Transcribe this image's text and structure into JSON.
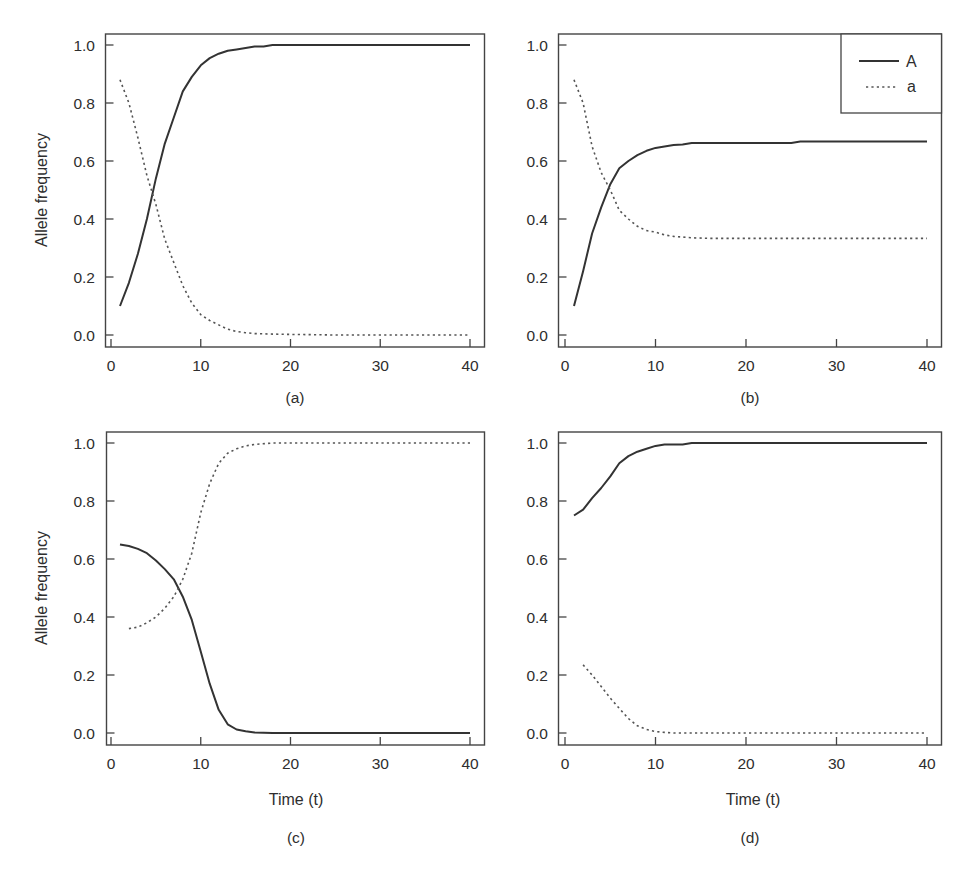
{
  "figure": {
    "y_axis_label": "Allele frequency",
    "x_axis_label": "Time (t)",
    "legend": {
      "solid_label": "A",
      "dotted_label": "a"
    },
    "x_ticks": [
      "0",
      "10",
      "20",
      "30",
      "40"
    ],
    "y_ticks": [
      "0.0",
      "0.2",
      "0.4",
      "0.6",
      "0.8",
      "1.0"
    ],
    "panels": [
      {
        "id": "a",
        "caption": "(a)"
      },
      {
        "id": "b",
        "caption": "(b)"
      },
      {
        "id": "c",
        "caption": "(c)"
      },
      {
        "id": "d",
        "caption": "(d)"
      }
    ]
  },
  "chart_data": [
    {
      "type": "line",
      "panel": "(a)",
      "title": "",
      "xlabel": "",
      "ylabel": "Allele frequency",
      "xlim": [
        0,
        40
      ],
      "ylim": [
        0,
        1
      ],
      "x_ticks": [
        0,
        10,
        20,
        30,
        40
      ],
      "y_ticks": [
        0.0,
        0.2,
        0.4,
        0.6,
        0.8,
        1.0
      ],
      "grid": false,
      "series": [
        {
          "name": "A",
          "style": "solid",
          "x": [
            1,
            2,
            3,
            4,
            5,
            6,
            7,
            8,
            9,
            10,
            11,
            12,
            13,
            14,
            15,
            16,
            17,
            18,
            20,
            25,
            30,
            35,
            40
          ],
          "values": [
            0.1,
            0.18,
            0.28,
            0.4,
            0.54,
            0.66,
            0.75,
            0.84,
            0.89,
            0.93,
            0.955,
            0.97,
            0.98,
            0.985,
            0.99,
            0.995,
            0.995,
            1.0,
            1.0,
            1.0,
            1.0,
            1.0,
            1.0
          ]
        },
        {
          "name": "a",
          "style": "dotted",
          "x": [
            1,
            2,
            3,
            4,
            5,
            6,
            7,
            8,
            9,
            10,
            11,
            12,
            13,
            14,
            15,
            16,
            18,
            20,
            25,
            30,
            35,
            40
          ],
          "values": [
            0.88,
            0.8,
            0.68,
            0.55,
            0.45,
            0.33,
            0.25,
            0.17,
            0.11,
            0.07,
            0.05,
            0.035,
            0.02,
            0.012,
            0.008,
            0.005,
            0.003,
            0.002,
            0.0,
            0.0,
            0.0,
            0.0
          ]
        }
      ]
    },
    {
      "type": "line",
      "panel": "(b)",
      "title": "",
      "xlabel": "",
      "ylabel": "",
      "xlim": [
        0,
        40
      ],
      "ylim": [
        0,
        1
      ],
      "x_ticks": [
        0,
        10,
        20,
        30,
        40
      ],
      "y_ticks": [
        0.0,
        0.2,
        0.4,
        0.6,
        0.8,
        1.0
      ],
      "grid": false,
      "legend": {
        "position": "upper right",
        "entries": [
          "A",
          "a"
        ]
      },
      "series": [
        {
          "name": "A",
          "style": "solid",
          "x": [
            1,
            2,
            3,
            4,
            5,
            6,
            7,
            8,
            9,
            10,
            11,
            12,
            13,
            14,
            16,
            20,
            25,
            26,
            30,
            35,
            40
          ],
          "values": [
            0.1,
            0.22,
            0.35,
            0.44,
            0.52,
            0.575,
            0.6,
            0.62,
            0.635,
            0.645,
            0.65,
            0.655,
            0.657,
            0.662,
            0.662,
            0.662,
            0.662,
            0.667,
            0.667,
            0.667,
            0.667
          ]
        },
        {
          "name": "a",
          "style": "dotted",
          "x": [
            1,
            2,
            3,
            4,
            5,
            6,
            7,
            8,
            9,
            10,
            11,
            12,
            14,
            16,
            20,
            25,
            30,
            35,
            40
          ],
          "values": [
            0.88,
            0.8,
            0.65,
            0.56,
            0.5,
            0.43,
            0.4,
            0.375,
            0.36,
            0.355,
            0.345,
            0.34,
            0.335,
            0.333,
            0.333,
            0.333,
            0.333,
            0.333,
            0.333
          ]
        }
      ]
    },
    {
      "type": "line",
      "panel": "(c)",
      "title": "",
      "xlabel": "Time (t)",
      "ylabel": "Allele frequency",
      "xlim": [
        0,
        40
      ],
      "ylim": [
        0,
        1
      ],
      "x_ticks": [
        0,
        10,
        20,
        30,
        40
      ],
      "y_ticks": [
        0.0,
        0.2,
        0.4,
        0.6,
        0.8,
        1.0
      ],
      "grid": false,
      "series": [
        {
          "name": "A",
          "style": "solid",
          "x": [
            1,
            2,
            3,
            4,
            5,
            6,
            7,
            8,
            9,
            10,
            11,
            12,
            13,
            14,
            15,
            16,
            18,
            20,
            25,
            30,
            35,
            40
          ],
          "values": [
            0.65,
            0.645,
            0.635,
            0.62,
            0.595,
            0.565,
            0.53,
            0.47,
            0.39,
            0.28,
            0.17,
            0.08,
            0.03,
            0.012,
            0.006,
            0.002,
            0.0,
            0.0,
            0.0,
            0.0,
            0.0,
            0.0
          ]
        },
        {
          "name": "a",
          "style": "dotted",
          "x": [
            2,
            3,
            4,
            5,
            6,
            7,
            8,
            9,
            10,
            11,
            12,
            13,
            14,
            15,
            16,
            18,
            20,
            25,
            30,
            35,
            40
          ],
          "values": [
            0.36,
            0.365,
            0.38,
            0.4,
            0.43,
            0.47,
            0.53,
            0.62,
            0.76,
            0.86,
            0.93,
            0.965,
            0.98,
            0.99,
            0.995,
            1.0,
            1.0,
            1.0,
            1.0,
            1.0,
            1.0
          ]
        }
      ]
    },
    {
      "type": "line",
      "panel": "(d)",
      "title": "",
      "xlabel": "Time (t)",
      "ylabel": "",
      "xlim": [
        0,
        40
      ],
      "ylim": [
        0,
        1
      ],
      "x_ticks": [
        0,
        10,
        20,
        30,
        40
      ],
      "y_ticks": [
        0.0,
        0.2,
        0.4,
        0.6,
        0.8,
        1.0
      ],
      "grid": false,
      "series": [
        {
          "name": "A",
          "style": "solid",
          "x": [
            1,
            2,
            3,
            4,
            5,
            6,
            7,
            8,
            9,
            10,
            11,
            12,
            13,
            14,
            16,
            20,
            25,
            30,
            35,
            40
          ],
          "values": [
            0.75,
            0.77,
            0.81,
            0.845,
            0.885,
            0.93,
            0.955,
            0.97,
            0.98,
            0.99,
            0.995,
            0.995,
            0.995,
            1.0,
            1.0,
            1.0,
            1.0,
            1.0,
            1.0,
            1.0
          ]
        },
        {
          "name": "a",
          "style": "dotted",
          "x": [
            2,
            3,
            4,
            5,
            6,
            7,
            8,
            9,
            10,
            11,
            12,
            15,
            20,
            25,
            30,
            35,
            40
          ],
          "values": [
            0.235,
            0.2,
            0.16,
            0.12,
            0.085,
            0.05,
            0.025,
            0.012,
            0.005,
            0.002,
            0.0,
            0.0,
            0.0,
            0.0,
            0.0,
            0.0,
            0.0
          ]
        }
      ]
    }
  ]
}
